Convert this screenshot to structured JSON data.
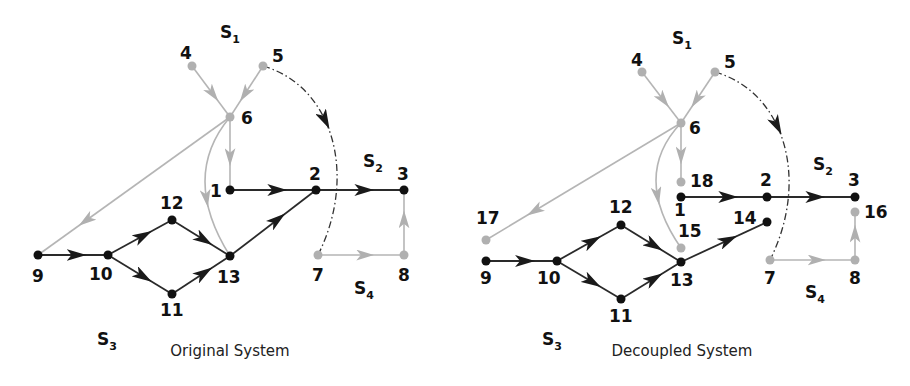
{
  "colors": {
    "dark": "#1a1a1a",
    "edge_dark": "#333333",
    "light": "#b5b5b5"
  },
  "panels": [
    {
      "id": "original",
      "caption": "Original System",
      "caption_pos": [
        230,
        356
      ],
      "subsystems": [
        {
          "label": "S",
          "sub": "1",
          "x": 220,
          "y": 38
        },
        {
          "label": "S",
          "sub": "2",
          "x": 364,
          "y": 167
        },
        {
          "label": "S",
          "sub": "3",
          "x": 97,
          "y": 142
        },
        {
          "label": "S",
          "sub": "4",
          "x": 355,
          "y": 113
        }
      ],
      "nodes": [
        {
          "id": "4",
          "x": 192,
          "y": 66,
          "shade": "light",
          "lx": 180,
          "ly": 59
        },
        {
          "id": "5",
          "x": 263,
          "y": 66,
          "shade": "light",
          "lx": 272,
          "ly": 62
        },
        {
          "id": "6",
          "x": 230,
          "y": 117,
          "shade": "light",
          "lx": 241,
          "ly": 124
        },
        {
          "id": "1",
          "x": 230,
          "y": 190,
          "shade": "dark",
          "lx": 210,
          "ly": 197
        },
        {
          "id": "2",
          "x": 316,
          "y": 190,
          "shade": "dark",
          "lx": 309,
          "ly": 180
        },
        {
          "id": "3",
          "x": 404,
          "y": 190,
          "shade": "dark",
          "lx": 397,
          "ly": 180
        },
        {
          "id": "12",
          "x": 172,
          "y": 220,
          "shade": "dark",
          "lx": 160,
          "ly": 209
        },
        {
          "id": "13",
          "x": 230,
          "y": 256,
          "shade": "dark",
          "lx": 217,
          "ly": 283
        },
        {
          "id": "9",
          "x": 38,
          "y": 255,
          "shade": "dark",
          "lx": 32,
          "ly": 282
        },
        {
          "id": "10",
          "x": 108,
          "y": 255,
          "shade": "dark",
          "lx": 89,
          "ly": 280
        },
        {
          "id": "11",
          "x": 172,
          "y": 294,
          "shade": "dark",
          "lx": 160,
          "ly": 316
        },
        {
          "id": "7",
          "x": 318,
          "y": 255,
          "shade": "light",
          "lx": 312,
          "ly": 281
        },
        {
          "id": "8",
          "x": 404,
          "y": 255,
          "shade": "light",
          "lx": 398,
          "ly": 281
        }
      ],
      "edges": [
        {
          "from": "4",
          "to": "6",
          "shade": "light"
        },
        {
          "from": "5",
          "to": "6",
          "shade": "light"
        },
        {
          "from": "6",
          "to": "1",
          "shade": "light"
        },
        {
          "from": "1",
          "to": "2",
          "shade": "dark"
        },
        {
          "from": "2",
          "to": "3",
          "shade": "dark"
        },
        {
          "from": "9",
          "to": "10",
          "shade": "dark"
        },
        {
          "from": "10",
          "to": "12",
          "shade": "dark"
        },
        {
          "from": "10",
          "to": "11",
          "shade": "dark"
        },
        {
          "from": "12",
          "to": "13",
          "shade": "dark"
        },
        {
          "from": "11",
          "to": "13",
          "shade": "dark"
        },
        {
          "from": "13",
          "to": "2",
          "shade": "dark"
        },
        {
          "from": "7",
          "to": "8",
          "shade": "light"
        },
        {
          "from": "8",
          "to": "3",
          "shade": "light"
        },
        {
          "from": "9",
          "to": "6",
          "shade": "light",
          "arrow_dir": "reverse"
        },
        {
          "from": "6",
          "to": "13",
          "shade": "light",
          "curve": true
        }
      ],
      "dashed": {
        "from": "5",
        "to": "7",
        "desc": "dash-dot coupling arc"
      }
    },
    {
      "id": "decoupled",
      "caption": "Decoupled System",
      "caption_pos": [
        682,
        356
      ],
      "subsystems": [
        {
          "label": "S",
          "sub": "1",
          "x": 672,
          "y": 44
        },
        {
          "label": "S",
          "sub": "2",
          "x": 814,
          "y": 170
        },
        {
          "label": "S",
          "sub": "3",
          "x": 542,
          "y": 145
        },
        {
          "label": "S",
          "sub": "4",
          "x": 805,
          "y": 113
        }
      ],
      "nodes": [
        {
          "id": "4",
          "x": 642,
          "y": 72,
          "shade": "light",
          "lx": 631,
          "ly": 66
        },
        {
          "id": "5",
          "x": 715,
          "y": 72,
          "shade": "light",
          "lx": 724,
          "ly": 68
        },
        {
          "id": "6",
          "x": 681,
          "y": 123,
          "shade": "light",
          "lx": 689,
          "ly": 134
        },
        {
          "id": "18",
          "x": 681,
          "y": 182,
          "shade": "light",
          "lx": 690,
          "ly": 187
        },
        {
          "id": "1",
          "x": 681,
          "y": 197,
          "shade": "dark",
          "lx": 674,
          "ly": 216
        },
        {
          "id": "2",
          "x": 767,
          "y": 197,
          "shade": "dark",
          "lx": 760,
          "ly": 186
        },
        {
          "id": "3",
          "x": 855,
          "y": 197,
          "shade": "dark",
          "lx": 848,
          "ly": 186
        },
        {
          "id": "16",
          "x": 855,
          "y": 212,
          "shade": "light",
          "lx": 864,
          "ly": 218
        },
        {
          "id": "17",
          "x": 486,
          "y": 240,
          "shade": "light",
          "lx": 476,
          "ly": 224
        },
        {
          "id": "9",
          "x": 486,
          "y": 261,
          "shade": "dark",
          "lx": 480,
          "ly": 284
        },
        {
          "id": "10",
          "x": 557,
          "y": 261,
          "shade": "dark",
          "lx": 537,
          "ly": 284
        },
        {
          "id": "12",
          "x": 621,
          "y": 225,
          "shade": "dark",
          "lx": 609,
          "ly": 213
        },
        {
          "id": "15",
          "x": 681,
          "y": 248,
          "shade": "light",
          "lx": 678,
          "ly": 237
        },
        {
          "id": "13",
          "x": 681,
          "y": 262,
          "shade": "dark",
          "lx": 670,
          "ly": 286
        },
        {
          "id": "14",
          "x": 767,
          "y": 222,
          "shade": "dark",
          "lx": 733,
          "ly": 224
        },
        {
          "id": "11",
          "x": 621,
          "y": 299,
          "shade": "dark",
          "lx": 609,
          "ly": 322
        },
        {
          "id": "7",
          "x": 770,
          "y": 260,
          "shade": "light",
          "lx": 764,
          "ly": 284
        },
        {
          "id": "8",
          "x": 855,
          "y": 260,
          "shade": "light",
          "lx": 849,
          "ly": 284
        }
      ],
      "edges": [
        {
          "from": "4",
          "to": "6",
          "shade": "light"
        },
        {
          "from": "5",
          "to": "6",
          "shade": "light"
        },
        {
          "from": "6",
          "to": "18",
          "shade": "light"
        },
        {
          "from": "1",
          "to": "2",
          "shade": "dark"
        },
        {
          "from": "2",
          "to": "3",
          "shade": "dark"
        },
        {
          "from": "9",
          "to": "10",
          "shade": "dark"
        },
        {
          "from": "10",
          "to": "12",
          "shade": "dark"
        },
        {
          "from": "10",
          "to": "11",
          "shade": "dark"
        },
        {
          "from": "12",
          "to": "13",
          "shade": "dark"
        },
        {
          "from": "11",
          "to": "13",
          "shade": "dark"
        },
        {
          "from": "13",
          "to": "14",
          "shade": "dark"
        },
        {
          "from": "7",
          "to": "8",
          "shade": "light"
        },
        {
          "from": "8",
          "to": "16",
          "shade": "light"
        },
        {
          "from": "17",
          "to": "6",
          "shade": "light",
          "arrow_dir": "reverse"
        },
        {
          "from": "6",
          "to": "15",
          "shade": "light",
          "curve": true
        }
      ],
      "dashed": {
        "from": "5",
        "to": "7",
        "desc": "dash-dot coupling arc"
      }
    }
  ]
}
